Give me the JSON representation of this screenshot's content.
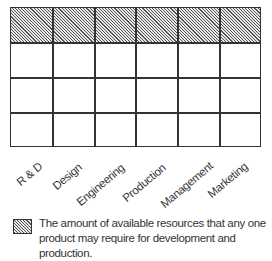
{
  "diagram": {
    "columns": [
      "R & D",
      "Design",
      "Engineering",
      "Production",
      "Management",
      "Marketing"
    ],
    "rows": 4,
    "shaded_row": 0,
    "colors": {
      "grid_line": "#333333",
      "hatch_dark": "#555555",
      "hatch_light": "#e8e8e8"
    }
  },
  "legend": {
    "swatch": "hatched-pattern",
    "text": "The amount of available resources that any one product may require for development and production."
  }
}
